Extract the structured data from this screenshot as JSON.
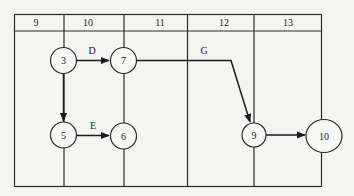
{
  "diagram": {
    "type": "time-scaled network (activity-on-arrow) diagram",
    "time_scale": [
      "9",
      "10",
      "11",
      "12",
      "13"
    ],
    "nodes": [
      {
        "id": "3",
        "label": "3"
      },
      {
        "id": "7",
        "label": "7"
      },
      {
        "id": "5",
        "label": "5"
      },
      {
        "id": "6",
        "label": "6"
      },
      {
        "id": "9",
        "label": "9"
      },
      {
        "id": "10",
        "label": "10"
      }
    ],
    "edges": [
      {
        "from": "3",
        "to": "7",
        "label": "D"
      },
      {
        "from": "3",
        "to": "5",
        "label": ""
      },
      {
        "from": "5",
        "to": "6",
        "label": "E"
      },
      {
        "from": "7",
        "to": "9",
        "label": "G"
      },
      {
        "from": "9",
        "to": "10",
        "label": ""
      }
    ]
  },
  "colors": {
    "line": "#2a2a2a",
    "background": "#f4f4f2"
  }
}
